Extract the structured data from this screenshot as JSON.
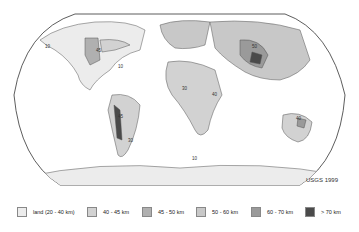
{
  "map": {
    "type": "world crustal thickness contour map",
    "contour_labels": [
      "10",
      "20",
      "30",
      "40",
      "45",
      "50",
      "60",
      "70"
    ],
    "credit": "USGS 1999"
  },
  "legend": {
    "items": [
      {
        "label": "land (20 - 40 km)",
        "color": "#ececec"
      },
      {
        "label": "40 - 45 km",
        "color": "#d2d2d2"
      },
      {
        "label": "45 - 50 km",
        "color": "#b0b0b0"
      },
      {
        "label": "50 - 60 km",
        "color": "#c8c8c8"
      },
      {
        "label": "60 - 70 km",
        "color": "#9a9a9a"
      },
      {
        "label": "> 70 km",
        "color": "#4a4a4a"
      }
    ]
  }
}
